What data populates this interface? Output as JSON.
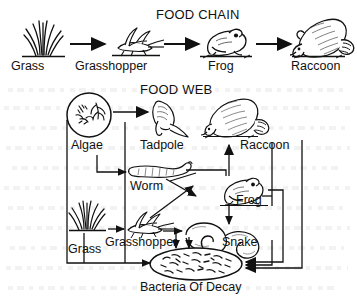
{
  "diagram": {
    "food_chain": {
      "title": "FOOD CHAIN",
      "nodes": [
        {
          "id": "grass",
          "label": "Grass",
          "icon": "grass-tuft-icon"
        },
        {
          "id": "grasshopper",
          "label": "Grasshopper",
          "icon": "grasshopper-icon"
        },
        {
          "id": "frog",
          "label": "Frog",
          "icon": "frog-icon"
        },
        {
          "id": "raccoon",
          "label": "Raccoon",
          "icon": "raccoon-icon"
        }
      ],
      "links": [
        {
          "from": "grass",
          "to": "grasshopper"
        },
        {
          "from": "grasshopper",
          "to": "frog"
        },
        {
          "from": "frog",
          "to": "raccoon"
        }
      ]
    },
    "food_web": {
      "title": "FOOD WEB",
      "nodes": [
        {
          "id": "algae",
          "label": "Algae",
          "icon": "algae-circle-icon"
        },
        {
          "id": "tadpole",
          "label": "Tadpole",
          "icon": "tadpole-icon"
        },
        {
          "id": "raccoon",
          "label": "Raccoon",
          "icon": "raccoon-icon"
        },
        {
          "id": "worm",
          "label": "Worm",
          "icon": "worm-icon"
        },
        {
          "id": "frog",
          "label": "Frog",
          "icon": "frog-icon"
        },
        {
          "id": "grass",
          "label": "Grass",
          "icon": "grass-tuft-icon"
        },
        {
          "id": "grasshopper",
          "label": "Grasshopper",
          "icon": "grasshopper-icon"
        },
        {
          "id": "snake",
          "label": "Snake",
          "icon": "snake-icon"
        },
        {
          "id": "bacteria",
          "label": "Bacteria Of Decay",
          "icon": "bacteria-colony-icon"
        }
      ],
      "links": [
        {
          "from": "algae",
          "to": "tadpole"
        },
        {
          "from": "algae",
          "to": "bacteria"
        },
        {
          "from": "tadpole",
          "to": "frog"
        },
        {
          "from": "grass",
          "to": "grasshopper"
        },
        {
          "from": "grass",
          "to": "worm"
        },
        {
          "from": "grass",
          "to": "bacteria"
        },
        {
          "from": "worm",
          "to": "frog"
        },
        {
          "from": "worm",
          "to": "snake"
        },
        {
          "from": "grasshopper",
          "to": "frog"
        },
        {
          "from": "grasshopper",
          "to": "snake"
        },
        {
          "from": "grasshopper",
          "to": "bacteria"
        },
        {
          "from": "frog",
          "to": "snake"
        },
        {
          "from": "frog",
          "to": "bacteria"
        },
        {
          "from": "snake",
          "to": "raccoon"
        },
        {
          "from": "snake",
          "to": "bacteria"
        },
        {
          "from": "raccoon",
          "to": "bacteria"
        }
      ]
    }
  },
  "colors": {
    "ink": "#111111",
    "paper": "#ffffff"
  }
}
